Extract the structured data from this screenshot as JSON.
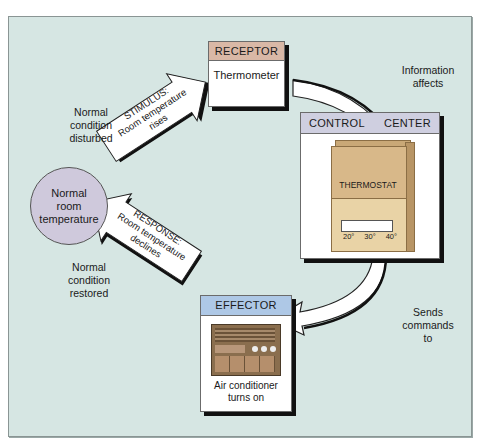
{
  "diagram": {
    "center_state": {
      "label": "Normal room temperature",
      "lines": [
        "Normal",
        "room",
        "temperature"
      ],
      "color": "#cfc9dc"
    },
    "receptor": {
      "header": "RECEPTOR",
      "body": "Thermometer",
      "header_color": "#d9b8a6"
    },
    "control_center": {
      "header_left": "CONTROL",
      "header_right": "CENTER",
      "device_label": "THERMOSTAT",
      "scale": [
        "20°",
        "30°",
        "40°"
      ],
      "header_color": "#cfcfe0",
      "device_color": "#d8b889"
    },
    "effector": {
      "header": "EFFECTOR",
      "body_lines": [
        "Air conditioner",
        "turns on"
      ],
      "header_color": "#aec8e6"
    },
    "stimulus_arrow": {
      "lines": [
        "STIMULUS:",
        "Room temperature",
        "rises"
      ]
    },
    "response_arrow": {
      "lines": [
        "RESPONSE:",
        "Room temperature",
        "declines"
      ]
    },
    "annotations": {
      "disturbed": [
        "Normal",
        "condition",
        "disturbed"
      ],
      "restored": [
        "Normal",
        "condition",
        "restored"
      ],
      "information": [
        "Information",
        "affects"
      ],
      "commands": [
        "Sends",
        "commands",
        "to"
      ]
    },
    "background_color": "#d6e6e3"
  }
}
